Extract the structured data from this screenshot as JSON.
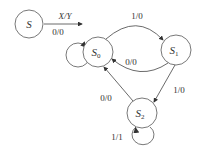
{
  "diagram": {
    "type": "state-diagram",
    "legend": {
      "state": "S",
      "arrow_label": "X/Y",
      "arrow_example": "0/0"
    },
    "states": [
      {
        "id": "S0",
        "name": "S",
        "sub": "0"
      },
      {
        "id": "S1",
        "name": "S",
        "sub": "1"
      },
      {
        "id": "S2",
        "name": "S",
        "sub": "2"
      }
    ],
    "transitions": [
      {
        "from": "S0",
        "to": "S0",
        "label": ""
      },
      {
        "from": "S0",
        "to": "S1",
        "label": "1/0"
      },
      {
        "from": "S1",
        "to": "S0",
        "label": "0/0"
      },
      {
        "from": "S1",
        "to": "S2",
        "label": "1/0"
      },
      {
        "from": "S2",
        "to": "S0",
        "label": "0/0"
      },
      {
        "from": "S2",
        "to": "S2",
        "label": "1/1"
      }
    ],
    "colors": {
      "stroke": "#444444",
      "text": "#333333"
    }
  }
}
